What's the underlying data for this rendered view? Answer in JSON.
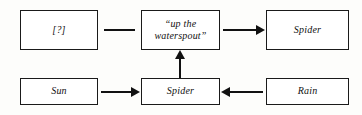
{
  "diagram": {
    "colors": {
      "stroke": "#111111",
      "box_fill": "#ffffff",
      "background": "#fdfdfb"
    },
    "nodes": [
      {
        "id": "unknown",
        "label": "[?]"
      },
      {
        "id": "phrase",
        "label": "“up the\nwaterspout”"
      },
      {
        "id": "spider_top",
        "label": "Spider"
      },
      {
        "id": "sun",
        "label": "Sun"
      },
      {
        "id": "spider_bottom",
        "label": "Spider"
      },
      {
        "id": "rain",
        "label": "Rain"
      }
    ],
    "edges": [
      {
        "id": "unknown-phrase",
        "from": "unknown",
        "to": "phrase",
        "style": "line",
        "direction": "none"
      },
      {
        "id": "phrase-spider",
        "from": "phrase",
        "to": "spider_top",
        "style": "arrow",
        "direction": "right"
      },
      {
        "id": "sun-spider",
        "from": "sun",
        "to": "spider_bottom",
        "style": "arrow",
        "direction": "right"
      },
      {
        "id": "rain-spider",
        "from": "rain",
        "to": "spider_bottom",
        "style": "arrow",
        "direction": "left"
      },
      {
        "id": "spider-phrase",
        "from": "spider_bottom",
        "to": "phrase",
        "style": "arrow",
        "direction": "up"
      }
    ]
  }
}
